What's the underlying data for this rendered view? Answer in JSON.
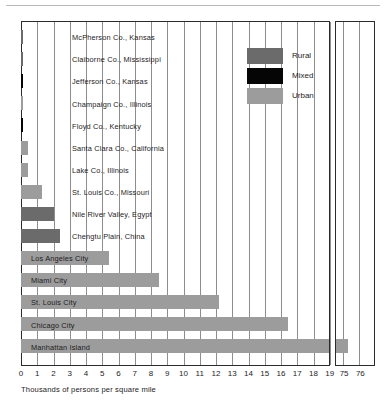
{
  "chart_data": {
    "type": "bar",
    "orientation": "horizontal",
    "title": "",
    "xlabel": "Thousands of persons per square mile",
    "ylabel": "",
    "grid": true,
    "axis_break": true,
    "xlim_main": [
      0,
      19.5
    ],
    "xlim_break": [
      74.5,
      76.2
    ],
    "xticks_main": [
      "0",
      "1",
      "2",
      "3",
      "4",
      "5",
      "6",
      "7",
      "8",
      "9",
      "10",
      "11",
      "12",
      "13",
      "14",
      "15",
      "16",
      "17",
      "18",
      "19"
    ],
    "xticks_break": [
      "75",
      "76"
    ],
    "legend": {
      "position": "inside-top-right",
      "entries": [
        {
          "label": "Rural",
          "color": "#6b6b6b"
        },
        {
          "label": "Mixed",
          "color": "#050505"
        },
        {
          "label": "Urban",
          "color": "#9c9c9c"
        }
      ]
    },
    "categories": [
      "McPherson Co., Kansas",
      "Claiborne Co., Mississippi",
      "Jefferson Co., Kansas",
      "Champaign Co., Illinois",
      "Floyd Co., Kentucky",
      "Santa Clara Co., California",
      "Lake Co., Illinois",
      "St. Louis Co., Missouri",
      "Nile River Valley, Egypt",
      "Chengtu Plain, China",
      "Los Angeles City",
      "Miami City",
      "St. Louis City",
      "Chicago City",
      "Manhattan Island"
    ],
    "values": [
      0.1,
      0.1,
      0.1,
      0.15,
      0.1,
      0.45,
      0.45,
      1.3,
      2.0,
      2.4,
      5.4,
      8.5,
      12.2,
      16.4,
      75.3
    ],
    "series_type": [
      "Rural",
      "Rural",
      "Mixed",
      "Urban",
      "Mixed",
      "Urban",
      "Urban",
      "Urban",
      "Rural",
      "Rural",
      "Urban",
      "Urban",
      "Urban",
      "Urban",
      "Urban"
    ],
    "bars": [
      {
        "label": "McPherson Co., Kansas",
        "value": 0.1,
        "type": "Rural",
        "color": "#6b6b6b"
      },
      {
        "label": "Claiborne Co., Mississippi",
        "value": 0.1,
        "type": "Rural",
        "color": "#6b6b6b"
      },
      {
        "label": "Jefferson Co., Kansas",
        "value": 0.1,
        "type": "Mixed",
        "color": "#050505"
      },
      {
        "label": "Champaign Co., Illinois",
        "value": 0.15,
        "type": "Urban",
        "color": "#9c9c9c"
      },
      {
        "label": "Floyd Co., Kentucky",
        "value": 0.1,
        "type": "Mixed",
        "color": "#050505"
      },
      {
        "label": "Santa Clara Co., California",
        "value": 0.45,
        "type": "Urban",
        "color": "#9c9c9c"
      },
      {
        "label": "Lake Co., Illinois",
        "value": 0.45,
        "type": "Urban",
        "color": "#9c9c9c"
      },
      {
        "label": "St. Louis Co., Missouri",
        "value": 1.3,
        "type": "Urban",
        "color": "#9c9c9c"
      },
      {
        "label": "Nile River Valley, Egypt",
        "value": 2.0,
        "type": "Rural",
        "color": "#6b6b6b"
      },
      {
        "label": "Chengtu Plain, China",
        "value": 2.4,
        "type": "Rural",
        "color": "#6b6b6b"
      },
      {
        "label": "Los Angeles City",
        "value": 5.4,
        "type": "Urban",
        "color": "#9c9c9c"
      },
      {
        "label": "Miami City",
        "value": 8.5,
        "type": "Urban",
        "color": "#9c9c9c"
      },
      {
        "label": "St. Louis City",
        "value": 12.2,
        "type": "Urban",
        "color": "#9c9c9c"
      },
      {
        "label": "Chicago City",
        "value": 16.4,
        "type": "Urban",
        "color": "#9c9c9c"
      },
      {
        "label": "Manhattan Island",
        "value": 75.3,
        "type": "Urban",
        "color": "#9c9c9c"
      }
    ]
  }
}
